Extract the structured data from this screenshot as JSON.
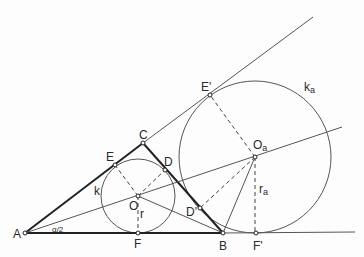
{
  "diagram": {
    "colors": {
      "line": "#3a3a3a",
      "thick": "#222222",
      "background": "#fdfdfd"
    },
    "points": {
      "A": {
        "label": "A",
        "x": 25,
        "y": 233
      },
      "B": {
        "label": "B",
        "x": 223,
        "y": 233
      },
      "C": {
        "label": "C",
        "x": 143,
        "y": 143
      },
      "E": {
        "label": "E",
        "x": 115,
        "y": 165
      },
      "D": {
        "label": "D",
        "x": 165,
        "y": 170
      },
      "O": {
        "label": "O",
        "x": 138,
        "y": 196
      },
      "F": {
        "label": "F",
        "x": 138,
        "y": 233
      },
      "E1": {
        "label": "E'",
        "x": 210,
        "y": 95
      },
      "D1": {
        "label": "D'",
        "x": 200,
        "y": 208
      },
      "Oa": {
        "label": "O",
        "sub": "a",
        "x": 255,
        "y": 157
      },
      "F1": {
        "label": "F'",
        "x": 256,
        "y": 233
      }
    },
    "circles": {
      "k": {
        "label": "k",
        "cx": 138,
        "cy": 196,
        "r": 37
      },
      "ka": {
        "label": "k",
        "sub": "a",
        "cx": 255,
        "cy": 157,
        "r": 76
      }
    },
    "labels": {
      "A": "A",
      "B": "B",
      "C": "C",
      "D": "D",
      "E": "E",
      "F": "F",
      "O": "O",
      "E1": "E'",
      "D1": "D'",
      "F1": "F'",
      "Oa_main": "O",
      "Oa_sub": "a",
      "k": "k",
      "ka_main": "k",
      "ka_sub": "a",
      "r": "r",
      "ra_main": "r",
      "ra_sub": "a",
      "half_alpha": "α/2"
    }
  }
}
